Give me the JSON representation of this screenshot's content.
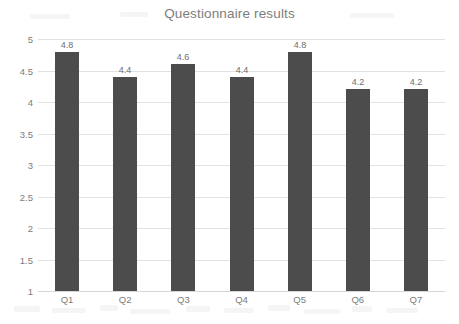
{
  "chart_data": {
    "type": "bar",
    "title": "Questionnaire results",
    "xlabel": "",
    "ylabel": "",
    "categories": [
      "Q1",
      "Q2",
      "Q3",
      "Q4",
      "Q5",
      "Q6",
      "Q7"
    ],
    "values": [
      4.8,
      4.4,
      4.6,
      4.4,
      4.8,
      4.2,
      4.2
    ],
    "value_labels": [
      "4.8",
      "4.4",
      "4.6",
      "4.4",
      "4.8",
      "4.2",
      "4.2"
    ],
    "ylim": [
      1,
      5
    ],
    "ytick_labels": [
      "5",
      "4.5",
      "4",
      "3.5",
      "3",
      "2.5",
      "2",
      "1.5",
      "1"
    ],
    "ytick_values": [
      5,
      4.5,
      4,
      3.5,
      3,
      2.5,
      2,
      1.5,
      1
    ],
    "grid": true,
    "legend": false,
    "legend_position": "none",
    "bar_color": "#4c4c4c",
    "gridline_color": "#e2e2e2",
    "text_color": "#7c7c7c",
    "title_color": "#7d7d7d",
    "background_color": "#ffffff",
    "data_labels_shown": true
  }
}
